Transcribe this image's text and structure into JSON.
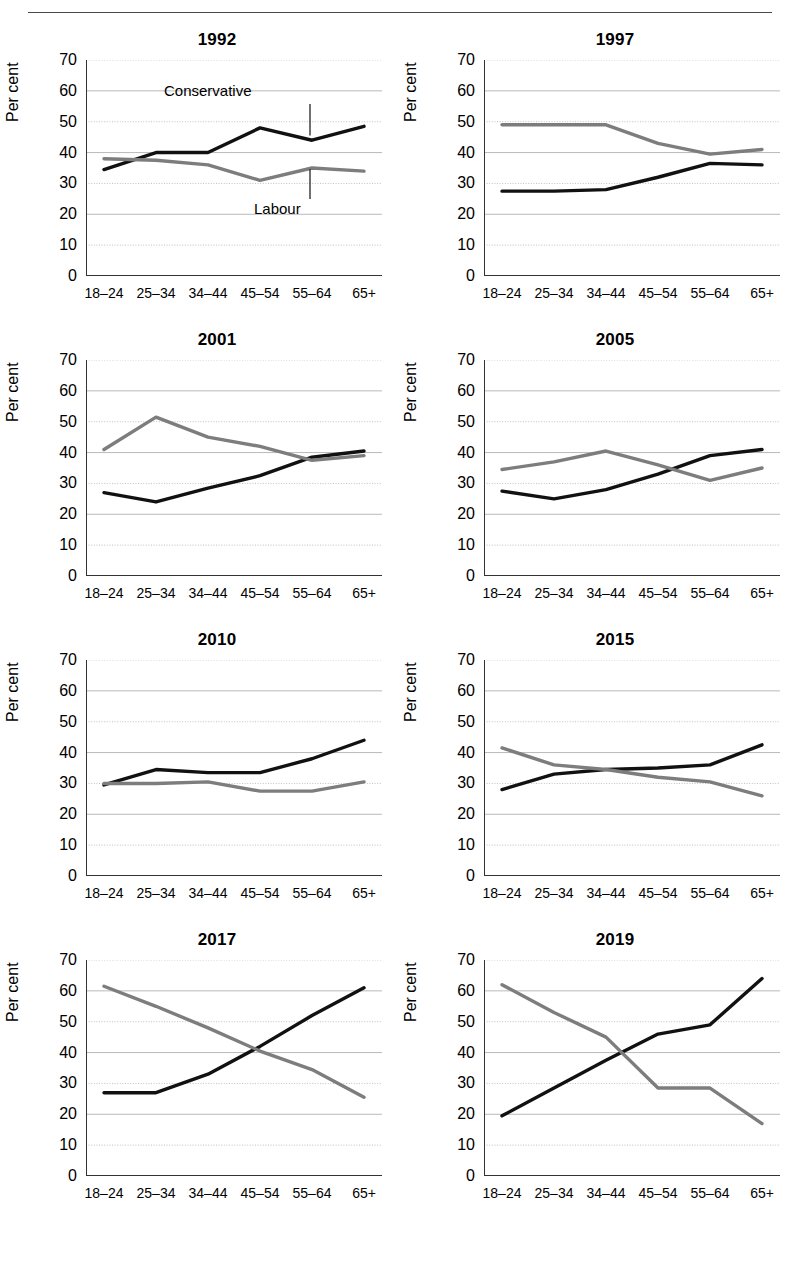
{
  "page": {
    "ylabel": "Per cent",
    "categories": [
      "18–24",
      "25–34",
      "34–44",
      "45–54",
      "55–64",
      "65+"
    ],
    "yticks": [
      "0",
      "10",
      "20",
      "30",
      "40",
      "50",
      "60",
      "70"
    ],
    "colors": {
      "conservative": "#111111",
      "labour": "#7d7d7d",
      "gridline": "#b9b9b9",
      "axis": "#333333"
    },
    "annotations": {
      "conservative": "Conservative",
      "labour": "Labour"
    }
  },
  "chart_data": [
    {
      "type": "line",
      "title": "1992",
      "xlabel": "",
      "ylabel": "Per cent",
      "ylim": [
        0,
        70
      ],
      "grid": true,
      "legend": "inline-annotation",
      "categories": [
        "18–24",
        "25–34",
        "34–44",
        "45–54",
        "55–64",
        "65+"
      ],
      "series": [
        {
          "name": "Conservative",
          "values": [
            34.5,
            40.0,
            40.0,
            48.0,
            44.0,
            48.5
          ]
        },
        {
          "name": "Labour",
          "values": [
            38.0,
            37.5,
            36.0,
            31.0,
            35.0,
            34.0
          ]
        }
      ]
    },
    {
      "type": "line",
      "title": "1997",
      "xlabel": "",
      "ylabel": "Per cent",
      "ylim": [
        0,
        70
      ],
      "grid": true,
      "categories": [
        "18–24",
        "25–34",
        "34–44",
        "45–54",
        "55–64",
        "65+"
      ],
      "series": [
        {
          "name": "Conservative",
          "values": [
            27.5,
            27.5,
            28.0,
            32.0,
            36.5,
            36.0
          ]
        },
        {
          "name": "Labour",
          "values": [
            49.0,
            49.0,
            49.0,
            43.0,
            39.5,
            41.0
          ]
        }
      ]
    },
    {
      "type": "line",
      "title": "2001",
      "xlabel": "",
      "ylabel": "Per cent",
      "ylim": [
        0,
        70
      ],
      "grid": true,
      "categories": [
        "18–24",
        "25–34",
        "34–44",
        "45–54",
        "55–64",
        "65+"
      ],
      "series": [
        {
          "name": "Conservative",
          "values": [
            27.0,
            24.0,
            28.5,
            32.5,
            38.5,
            40.5
          ]
        },
        {
          "name": "Labour",
          "values": [
            41.0,
            51.5,
            45.0,
            42.0,
            37.5,
            39.0
          ]
        }
      ]
    },
    {
      "type": "line",
      "title": "2005",
      "xlabel": "",
      "ylabel": "Per cent",
      "ylim": [
        0,
        70
      ],
      "grid": true,
      "categories": [
        "18–24",
        "25–34",
        "34–44",
        "45–54",
        "55–64",
        "65+"
      ],
      "series": [
        {
          "name": "Conservative",
          "values": [
            27.5,
            25.0,
            28.0,
            33.0,
            39.0,
            41.0
          ]
        },
        {
          "name": "Labour",
          "values": [
            34.5,
            37.0,
            40.5,
            36.0,
            31.0,
            35.0
          ]
        }
      ]
    },
    {
      "type": "line",
      "title": "2010",
      "xlabel": "",
      "ylabel": "Per cent",
      "ylim": [
        0,
        70
      ],
      "grid": true,
      "categories": [
        "18–24",
        "25–34",
        "34–44",
        "45–54",
        "55–64",
        "65+"
      ],
      "series": [
        {
          "name": "Conservative",
          "values": [
            29.5,
            34.5,
            33.5,
            33.5,
            38.0,
            44.0
          ]
        },
        {
          "name": "Labour",
          "values": [
            30.0,
            30.0,
            30.5,
            27.5,
            27.5,
            30.5
          ]
        }
      ]
    },
    {
      "type": "line",
      "title": "2015",
      "xlabel": "",
      "ylabel": "Per cent",
      "ylim": [
        0,
        70
      ],
      "grid": true,
      "categories": [
        "18–24",
        "25–34",
        "34–44",
        "45–54",
        "55–64",
        "65+"
      ],
      "series": [
        {
          "name": "Conservative",
          "values": [
            28.0,
            33.0,
            34.5,
            35.0,
            36.0,
            42.5
          ]
        },
        {
          "name": "Labour",
          "values": [
            41.5,
            36.0,
            34.5,
            32.0,
            30.5,
            26.0
          ]
        }
      ]
    },
    {
      "type": "line",
      "title": "2017",
      "xlabel": "",
      "ylabel": "Per cent",
      "ylim": [
        0,
        70
      ],
      "grid": true,
      "categories": [
        "18–24",
        "25–34",
        "34–44",
        "45–54",
        "55–64",
        "65+"
      ],
      "series": [
        {
          "name": "Conservative",
          "values": [
            27.0,
            27.0,
            33.0,
            42.0,
            52.0,
            61.0
          ]
        },
        {
          "name": "Labour",
          "values": [
            61.5,
            55.0,
            48.0,
            40.5,
            34.5,
            25.5
          ]
        }
      ]
    },
    {
      "type": "line",
      "title": "2019",
      "xlabel": "",
      "ylabel": "Per cent",
      "ylim": [
        0,
        70
      ],
      "grid": true,
      "categories": [
        "18–24",
        "25–34",
        "34–44",
        "45–54",
        "55–64",
        "65+"
      ],
      "series": [
        {
          "name": "Conservative",
          "values": [
            19.5,
            28.5,
            37.5,
            46.0,
            49.0,
            64.0
          ]
        },
        {
          "name": "Labour",
          "values": [
            62.0,
            53.0,
            45.0,
            28.5,
            28.5,
            17.0
          ]
        }
      ]
    }
  ]
}
